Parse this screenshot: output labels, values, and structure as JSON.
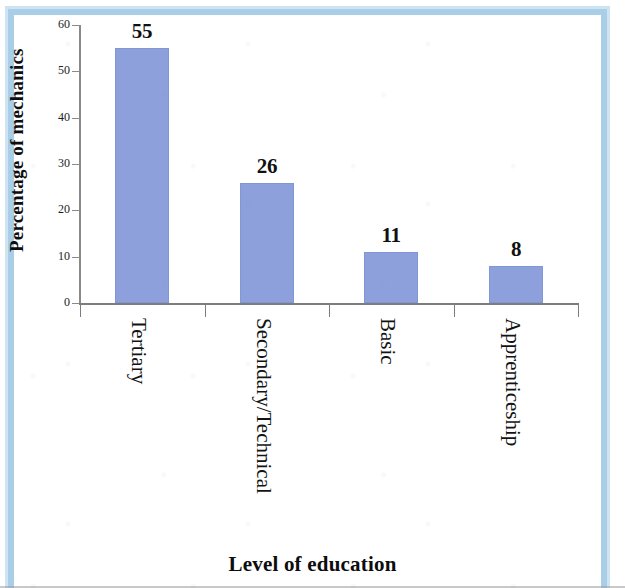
{
  "chart_data": {
    "type": "bar",
    "title": "",
    "subtitle": "",
    "categories": [
      "Tertiary",
      "Secondary/Technical",
      "Basic",
      "Apprenticeship"
    ],
    "values": [
      55,
      26,
      11,
      8
    ],
    "data_labels": [
      "55",
      "26",
      "11",
      "8"
    ],
    "xlabel": "Level of education",
    "ylabel": "Percentage of mechanics",
    "ylim": [
      0,
      60
    ],
    "ytick_values": [
      0,
      10,
      20,
      30,
      40,
      50,
      60
    ],
    "ytick_labels": [
      "0",
      "10",
      "20",
      "30",
      "40",
      "50",
      "60"
    ],
    "grid": false,
    "legend": false,
    "legend_position": "none",
    "bar_color": "#8ea0dc",
    "bar_edge_color": "#8097d6",
    "axis_color": "#8a8a8a",
    "text_color": "#111111",
    "x_tick_label_rotation": 90
  },
  "page": {
    "border_color": "#a8cee8",
    "border_inner_color": "#cfe4f2",
    "background_color": "#ffffff"
  },
  "axes": {
    "y_title": "Percentage of mechanics",
    "x_title": "Level of education"
  }
}
